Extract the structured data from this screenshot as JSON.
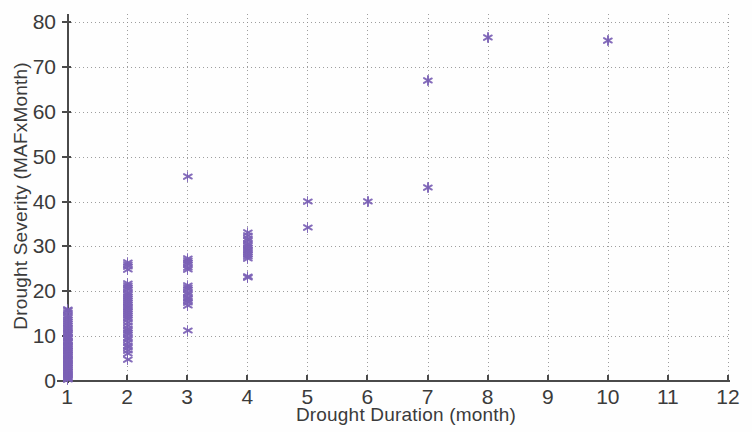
{
  "figure": {
    "background": "#fefefe",
    "marker_color": "#7b61b5",
    "axis_color": "#4a4a4a",
    "grid_color": "#8d8d8d"
  },
  "axes": {
    "x_title": "Drought Duration  (month)",
    "y_title": "Drought Severity  (MAFxMonth)",
    "x_ticks": [
      "1",
      "2",
      "3",
      "4",
      "5",
      "6",
      "7",
      "8",
      "9",
      "10",
      "11",
      "12"
    ],
    "y_ticks": [
      "0",
      "10",
      "20",
      "30",
      "40",
      "50",
      "60",
      "70",
      "80"
    ]
  },
  "chart_data": {
    "type": "scatter",
    "title": "",
    "xlabel": "Drought Duration  (month)",
    "ylabel": "Drought Severity  (MAFxMonth)",
    "xlim": [
      1,
      12
    ],
    "ylim": [
      0,
      80
    ],
    "xticks": [
      1,
      2,
      3,
      4,
      5,
      6,
      7,
      8,
      9,
      10,
      11,
      12
    ],
    "yticks": [
      0,
      10,
      20,
      30,
      40,
      50,
      60,
      70,
      80
    ],
    "grid": true,
    "legend": null,
    "marker": "asterisk",
    "series": [
      {
        "name": "Drought events",
        "color": "#7b61b5",
        "points": [
          [
            1,
            0.4
          ],
          [
            1,
            0.6
          ],
          [
            1,
            0.8
          ],
          [
            1,
            1.0
          ],
          [
            1,
            1.2
          ],
          [
            1,
            1.5
          ],
          [
            1,
            1.7
          ],
          [
            1,
            1.9
          ],
          [
            1,
            2.1
          ],
          [
            1,
            2.4
          ],
          [
            1,
            2.6
          ],
          [
            1,
            2.9
          ],
          [
            1,
            3.1
          ],
          [
            1,
            3.4
          ],
          [
            1,
            3.6
          ],
          [
            1,
            3.9
          ],
          [
            1,
            4.1
          ],
          [
            1,
            4.4
          ],
          [
            1,
            4.6
          ],
          [
            1,
            4.9
          ],
          [
            1,
            5.1
          ],
          [
            1,
            5.4
          ],
          [
            1,
            5.6
          ],
          [
            1,
            5.9
          ],
          [
            1,
            6.1
          ],
          [
            1,
            6.4
          ],
          [
            1,
            6.7
          ],
          [
            1,
            6.9
          ],
          [
            1,
            7.2
          ],
          [
            1,
            7.4
          ],
          [
            1,
            7.7
          ],
          [
            1,
            7.9
          ],
          [
            1,
            8.2
          ],
          [
            1,
            8.5
          ],
          [
            1,
            8.8
          ],
          [
            1,
            9.1
          ],
          [
            1,
            9.4
          ],
          [
            1,
            9.7
          ],
          [
            1,
            10.0
          ],
          [
            1,
            10.3
          ],
          [
            1,
            10.6
          ],
          [
            1,
            10.9
          ],
          [
            1,
            11.2
          ],
          [
            1,
            11.6
          ],
          [
            1,
            12.0
          ],
          [
            1,
            12.4
          ],
          [
            1,
            12.8
          ],
          [
            1,
            13.2
          ],
          [
            1,
            13.7
          ],
          [
            1,
            14.2
          ],
          [
            1,
            14.7
          ],
          [
            1,
            15.2
          ],
          [
            1,
            15.6
          ],
          [
            1,
            15.9
          ],
          [
            2,
            4.8
          ],
          [
            2,
            6.2
          ],
          [
            2,
            6.9
          ],
          [
            2,
            7.4
          ],
          [
            2,
            8.0
          ],
          [
            2,
            8.6
          ],
          [
            2,
            9.2
          ],
          [
            2,
            9.8
          ],
          [
            2,
            10.3
          ],
          [
            2,
            10.8
          ],
          [
            2,
            11.2
          ],
          [
            2,
            11.8
          ],
          [
            2,
            12.4
          ],
          [
            2,
            13.0
          ],
          [
            2,
            13.6
          ],
          [
            2,
            14.2
          ],
          [
            2,
            14.7
          ],
          [
            2,
            15.1
          ],
          [
            2,
            15.5
          ],
          [
            2,
            15.9
          ],
          [
            2,
            16.3
          ],
          [
            2,
            16.7
          ],
          [
            2,
            17.1
          ],
          [
            2,
            17.5
          ],
          [
            2,
            17.9
          ],
          [
            2,
            18.3
          ],
          [
            2,
            18.8
          ],
          [
            2,
            19.3
          ],
          [
            2,
            19.8
          ],
          [
            2,
            20.3
          ],
          [
            2,
            20.8
          ],
          [
            2,
            21.3
          ],
          [
            2,
            21.7
          ],
          [
            2,
            24.9
          ],
          [
            2,
            25.5
          ],
          [
            2,
            26.0
          ],
          [
            2,
            26.4
          ],
          [
            3,
            11.2
          ],
          [
            3,
            16.9
          ],
          [
            3,
            17.4
          ],
          [
            3,
            17.9
          ],
          [
            3,
            18.3
          ],
          [
            3,
            18.7
          ],
          [
            3,
            19.2
          ],
          [
            3,
            19.8
          ],
          [
            3,
            20.3
          ],
          [
            3,
            20.8
          ],
          [
            3,
            21.2
          ],
          [
            3,
            24.9
          ],
          [
            3,
            25.4
          ],
          [
            3,
            25.9
          ],
          [
            3,
            26.4
          ],
          [
            3,
            26.9
          ],
          [
            3,
            27.2
          ],
          [
            3,
            45.6
          ],
          [
            4,
            23.0
          ],
          [
            4,
            23.3
          ],
          [
            4,
            27.3
          ],
          [
            4,
            27.8
          ],
          [
            4,
            28.2
          ],
          [
            4,
            28.6
          ],
          [
            4,
            29.0
          ],
          [
            4,
            29.4
          ],
          [
            4,
            29.8
          ],
          [
            4,
            30.2
          ],
          [
            4,
            30.7
          ],
          [
            4,
            31.2
          ],
          [
            4,
            31.8
          ],
          [
            4,
            32.4
          ],
          [
            4,
            33.0
          ],
          [
            5,
            34.3
          ],
          [
            5,
            40.0
          ],
          [
            6,
            40.1
          ],
          [
            7,
            43.1
          ],
          [
            7,
            67.0
          ],
          [
            8,
            76.5
          ],
          [
            10,
            75.9
          ]
        ]
      }
    ]
  }
}
